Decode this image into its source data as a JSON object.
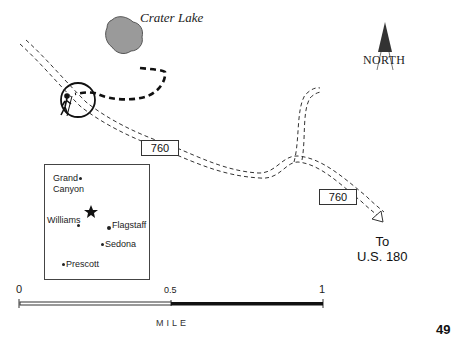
{
  "map": {
    "lake_label": "Crater Lake",
    "north_label": "NORTH",
    "road_signs": [
      "760",
      "760"
    ],
    "destination": {
      "line1": "To",
      "line2": "U.S. 180"
    },
    "inset": {
      "cities": [
        {
          "name": "Grand",
          "name2": "Canyon"
        },
        {
          "name": "Williams"
        },
        {
          "name": "Flagstaff"
        },
        {
          "name": "Sedona"
        },
        {
          "name": "Prescott"
        }
      ],
      "marker": "star"
    },
    "scale": {
      "ticks": [
        "0",
        "0.5",
        "1"
      ],
      "unit": "MILE"
    },
    "page_number": "49"
  }
}
